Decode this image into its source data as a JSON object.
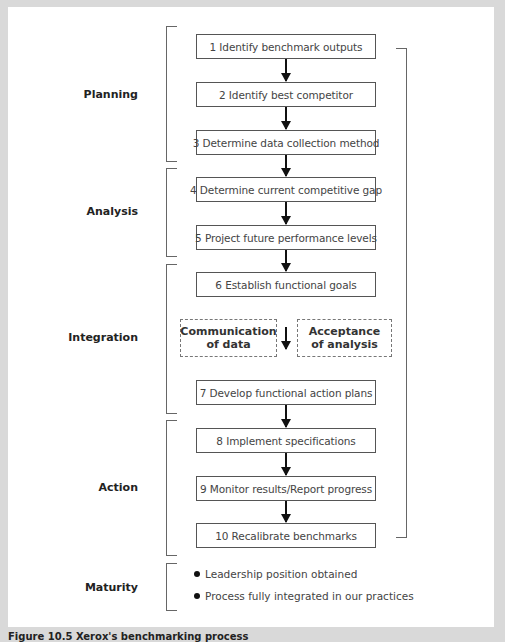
{
  "diagram": {
    "stages": [
      {
        "label": "Planning"
      },
      {
        "label": "Analysis"
      },
      {
        "label": "Integration"
      },
      {
        "label": "Action"
      },
      {
        "label": "Maturity"
      }
    ],
    "steps": [
      {
        "label": "1 Identify benchmark outputs"
      },
      {
        "label": "2 Identify best competitor"
      },
      {
        "label": "3 Determine data collection method"
      },
      {
        "label": "4 Determine current competitive gap"
      },
      {
        "label": "5 Project future performance levels"
      },
      {
        "label": "6 Establish functional goals"
      },
      {
        "label": "7 Develop functional action plans"
      },
      {
        "label": "8 Implement specifications"
      },
      {
        "label": "9 Monitor results/Report progress"
      },
      {
        "label": "10 Recalibrate benchmarks"
      }
    ],
    "integration_notes": [
      {
        "line1": "Communication",
        "line2": "of data"
      },
      {
        "line1": "Acceptance",
        "line2": "of analysis"
      }
    ],
    "maturity_items": [
      {
        "label": "Leadership position obtained"
      },
      {
        "label": "Process fully integrated in our practices"
      }
    ],
    "caption": "Figure 10.5  Xerox's benchmarking process"
  }
}
